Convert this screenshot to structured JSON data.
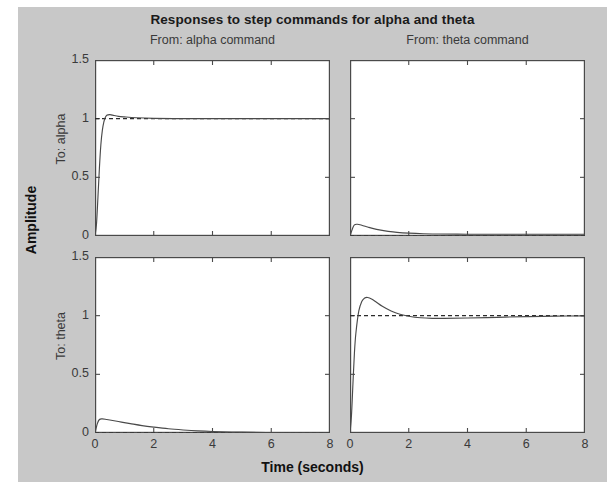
{
  "figure": {
    "background_color": "#c8c8c8",
    "plot_background_color": "#ffffff",
    "axis_color": "#4a4a4a",
    "curve_color": "#4a4a4a",
    "reference_line_color": "#2b2b2b"
  },
  "chart_data": {
    "type": "line",
    "title": "Responses to step commands for alpha and theta",
    "xlabel": "Time (seconds)",
    "ylabel": "Amplitude",
    "grid": false,
    "legend": null,
    "layout": "2x2 grid of subplots",
    "column_titles": [
      "From: alpha command",
      "From: theta command"
    ],
    "row_titles": [
      "To: alpha",
      "To: theta"
    ],
    "xlim": [
      0,
      8
    ],
    "ylim": [
      0,
      1.5
    ],
    "xticks": [
      0,
      2,
      4,
      6,
      8
    ],
    "xtick_labels": [
      "0",
      "2",
      "4",
      "6",
      "8"
    ],
    "yticks": [
      0,
      0.5,
      1,
      1.5
    ],
    "ytick_labels": [
      "0",
      "0.5",
      "1",
      "1.5"
    ],
    "subplots": [
      {
        "name": "alpha-command-to-alpha",
        "row": 0,
        "col": 0,
        "reference_value": 1.0,
        "x": [
          0,
          0.05,
          0.1,
          0.15,
          0.2,
          0.25,
          0.3,
          0.35,
          0.4,
          0.5,
          0.6,
          0.8,
          1.0,
          1.4,
          2.0,
          3.0,
          4.0,
          5.0,
          6.0,
          7.0,
          8.0
        ],
        "y": [
          0,
          0.1,
          0.33,
          0.58,
          0.78,
          0.9,
          0.97,
          1.01,
          1.03,
          1.035,
          1.03,
          1.02,
          1.015,
          1.008,
          1.003,
          1.0,
          1.0,
          1.0,
          1.0,
          1.0,
          1.0
        ]
      },
      {
        "name": "theta-command-to-alpha",
        "row": 0,
        "col": 1,
        "reference_value": 0.0,
        "x": [
          0,
          0.08,
          0.15,
          0.25,
          0.4,
          0.6,
          0.8,
          1.0,
          1.3,
          1.6,
          2.0,
          2.5,
          3.0,
          4.0,
          5.0,
          6.0,
          7.0,
          8.0
        ],
        "y": [
          0,
          0.06,
          0.095,
          0.1,
          0.092,
          0.077,
          0.063,
          0.052,
          0.04,
          0.031,
          0.024,
          0.019,
          0.017,
          0.015,
          0.015,
          0.015,
          0.015,
          0.015
        ]
      },
      {
        "name": "alpha-command-to-theta",
        "row": 1,
        "col": 0,
        "reference_value": 0.0,
        "x": [
          0,
          0.08,
          0.15,
          0.25,
          0.4,
          0.6,
          0.9,
          1.2,
          1.6,
          2.0,
          2.5,
          3.0,
          3.5,
          4.0,
          5.0,
          6.0,
          7.0,
          8.0
        ],
        "y": [
          0,
          0.08,
          0.115,
          0.12,
          0.115,
          0.107,
          0.093,
          0.08,
          0.063,
          0.05,
          0.036,
          0.026,
          0.018,
          0.013,
          0.007,
          0.004,
          0.002,
          0.001
        ]
      },
      {
        "name": "theta-command-to-theta",
        "row": 1,
        "col": 1,
        "reference_value": 1.0,
        "x": [
          0,
          0.05,
          0.1,
          0.15,
          0.2,
          0.3,
          0.4,
          0.5,
          0.6,
          0.75,
          0.9,
          1.1,
          1.4,
          1.7,
          2.0,
          2.4,
          2.8,
          3.2,
          4.0,
          5.0,
          6.0,
          7.0,
          8.0
        ],
        "y": [
          0,
          0.15,
          0.42,
          0.68,
          0.85,
          1.04,
          1.12,
          1.15,
          1.155,
          1.14,
          1.115,
          1.08,
          1.04,
          1.012,
          0.995,
          0.982,
          0.977,
          0.977,
          0.98,
          0.986,
          0.992,
          0.996,
          0.998
        ]
      }
    ]
  }
}
